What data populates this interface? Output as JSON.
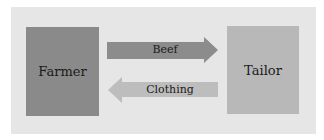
{
  "diagram": {
    "nodes": [
      {
        "id": "farmer",
        "label": "Farmer",
        "color": "#8a8a8a"
      },
      {
        "id": "tailor",
        "label": "Tailor",
        "color": "#b8b8b8"
      }
    ],
    "edges": [
      {
        "from": "farmer",
        "to": "tailor",
        "label": "Beef",
        "color": "#8c8c8c"
      },
      {
        "from": "tailor",
        "to": "farmer",
        "label": "Clothing",
        "color": "#bdbdbd"
      }
    ],
    "background": "#e6e6e6"
  }
}
